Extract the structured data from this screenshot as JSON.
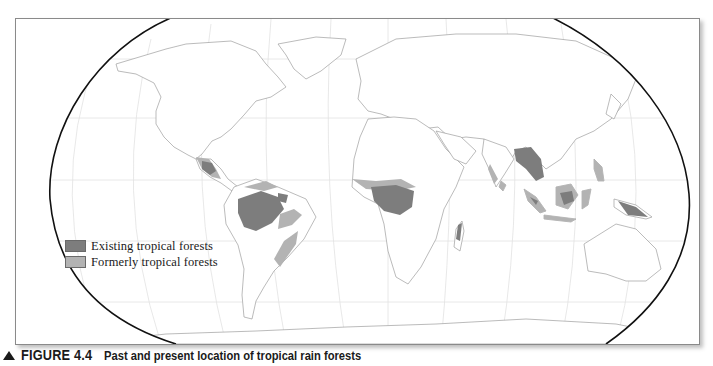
{
  "figure": {
    "number_label": "FIGURE 4.4",
    "title": "Past and present location of tropical rain forests",
    "marker_icon": "triangle-up-icon"
  },
  "map": {
    "projection": "Robinson (world)",
    "colors": {
      "existing": "#7d7d7d",
      "formerly": "#b3b3b3",
      "land": "#ffffff",
      "coast": "#a8a8a8",
      "graticule": "#dcdcdc",
      "outline": "#111111"
    },
    "regions_existing": [
      "Central America",
      "Amazon Basin",
      "Atlantic coast of Brazil",
      "Congo Basin",
      "Eastern Madagascar",
      "Southeast Asia mainland",
      "Borneo",
      "Sumatra",
      "New Guinea"
    ],
    "regions_formerly": [
      "Southern Mexico",
      "Colombia/Venezuela coast",
      "Eastern Amazon",
      "West Africa coast",
      "India Western Ghats",
      "Sri Lanka",
      "Philippines",
      "Java",
      "Northeast Australia"
    ]
  },
  "legend": {
    "items": [
      {
        "label": "Existing tropical forests",
        "color": "#7d7d7d"
      },
      {
        "label": "Formerly tropical forests",
        "color": "#b3b3b3"
      }
    ]
  }
}
